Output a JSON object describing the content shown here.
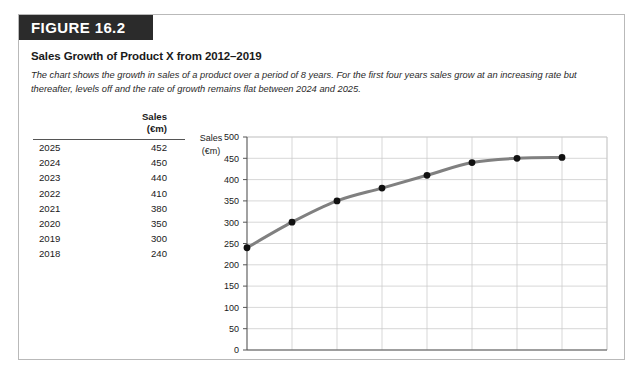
{
  "figure": {
    "banner_label": "FIGURE 16.2",
    "title": "Sales Growth of Product X from 2012–2019",
    "description": "The chart shows the growth in sales of a product over a period of 8 years. For the first four years sales grow at an increasing rate but thereafter, levels off and the rate of growth remains flat between 2024 and 2025."
  },
  "table": {
    "header_year": "",
    "header_sales_line1": "Sales",
    "header_sales_line2": "(€m)",
    "rows": [
      {
        "year": "2025",
        "value": "452"
      },
      {
        "year": "2024",
        "value": "450"
      },
      {
        "year": "2023",
        "value": "440"
      },
      {
        "year": "2022",
        "value": "410"
      },
      {
        "year": "2021",
        "value": "380"
      },
      {
        "year": "2020",
        "value": "350"
      },
      {
        "year": "2019",
        "value": "300"
      },
      {
        "year": "2018",
        "value": "240"
      }
    ]
  },
  "chart_data": {
    "type": "line",
    "title": "Sales Growth of Product X from 2012–2019",
    "xlabel": "",
    "ylabel": "Sales (€m)",
    "ylabel_line1": "Sales",
    "ylabel_line2": "(€m)",
    "x": [
      2018,
      2019,
      2020,
      2021,
      2022,
      2023,
      2024,
      2025
    ],
    "values": [
      240,
      300,
      350,
      380,
      410,
      440,
      450,
      452
    ],
    "series": [
      {
        "name": "Sales (€m)",
        "values": [
          240,
          300,
          350,
          380,
          410,
          440,
          450,
          452
        ]
      }
    ],
    "xlim": [
      2018,
      2026
    ],
    "ylim": [
      0,
      500
    ],
    "ytick_step": 50,
    "yticks": [
      0,
      50,
      100,
      150,
      200,
      250,
      300,
      350,
      400,
      450,
      500
    ],
    "ytick_labels": [
      "0",
      "50",
      "100",
      "150",
      "200",
      "250",
      "300",
      "350",
      "400",
      "450",
      "500"
    ],
    "xticks": [
      2018,
      2019,
      2020,
      2021,
      2022,
      2023,
      2024,
      2025,
      2026
    ],
    "xtick_labels": [
      "2018",
      "2019",
      "2020",
      "2021",
      "2022",
      "2023",
      "2024",
      "2025",
      "2026"
    ],
    "grid": true,
    "legend": false,
    "line_color": "#808080",
    "marker_color": "#111111",
    "grid_color": "#c9c9c9",
    "axis_color": "#555555"
  },
  "colors": {
    "banner_bg": "#2b2b2b",
    "banner_text": "#ffffff",
    "frame_border": "#b9b9b9",
    "page_bg": "#ffffff"
  }
}
